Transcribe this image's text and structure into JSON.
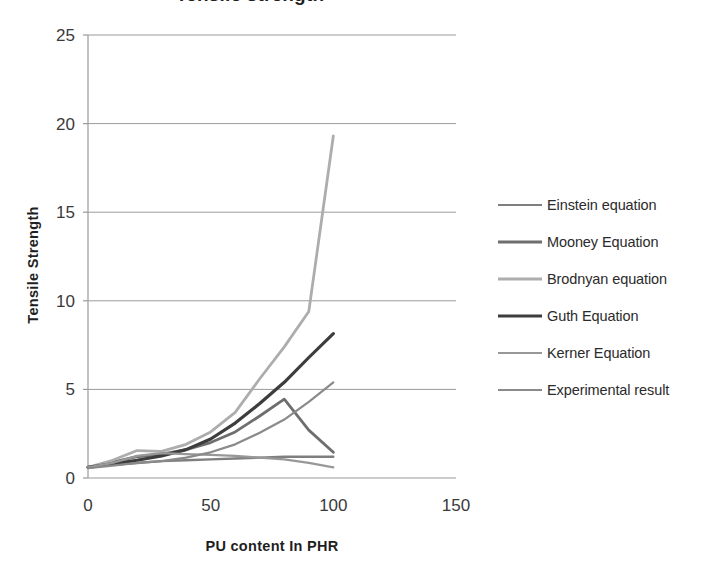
{
  "chart_data": {
    "type": "line",
    "title": "Tensile strength",
    "xlabel": "PU content In PHR",
    "ylabel": "Tensile Strength",
    "xlim": [
      0,
      150
    ],
    "ylim": [
      0,
      25
    ],
    "xticks": [
      0,
      50,
      100,
      150
    ],
    "yticks": [
      0,
      5,
      10,
      15,
      20,
      25
    ],
    "xtick_labels": [
      "0",
      "50",
      "100",
      "150"
    ],
    "ytick_labels": [
      "0",
      "5",
      "10",
      "15",
      "20",
      "25"
    ],
    "grid": "horizontal",
    "legend_position": "right",
    "x": [
      0,
      10,
      20,
      30,
      40,
      50,
      60,
      70,
      80,
      90,
      100
    ],
    "series": [
      {
        "name": "Einstein equation",
        "color": "#7f7f7f",
        "width": 2.4,
        "values": [
          0.6,
          0.75,
          0.85,
          0.95,
          1.0,
          1.05,
          1.1,
          1.15,
          1.2,
          1.2,
          1.2
        ]
      },
      {
        "name": "Mooney Equation",
        "color": "#6e6e6e",
        "width": 2.8,
        "values": [
          0.6,
          0.9,
          1.2,
          1.35,
          1.6,
          2.0,
          2.6,
          3.5,
          4.45,
          2.7,
          1.45
        ]
      },
      {
        "name": "Brodnyan equation",
        "color": "#adadad",
        "width": 2.8,
        "values": [
          0.6,
          1.0,
          1.55,
          1.5,
          1.9,
          2.6,
          3.7,
          5.6,
          7.4,
          9.4,
          19.3
        ]
      },
      {
        "name": "Guth Equation",
        "color": "#3d3d3d",
        "width": 3.2,
        "values": [
          0.6,
          0.8,
          1.0,
          1.25,
          1.6,
          2.2,
          3.1,
          4.2,
          5.4,
          6.8,
          8.15
        ]
      },
      {
        "name": "Kerner Equation",
        "color": "#989898",
        "width": 2.2,
        "values": [
          0.6,
          0.85,
          1.25,
          1.4,
          1.35,
          1.3,
          1.25,
          1.15,
          1.05,
          0.85,
          0.6
        ]
      },
      {
        "name": "Experimental result",
        "color": "#8a8a8a",
        "width": 2.2,
        "values": [
          0.55,
          0.7,
          0.85,
          0.95,
          1.15,
          1.45,
          1.9,
          2.55,
          3.3,
          4.3,
          5.4
        ]
      }
    ]
  },
  "legend": {
    "items": [
      {
        "label": "Einstein equation"
      },
      {
        "label": "Mooney Equation"
      },
      {
        "label": "Brodnyan equation"
      },
      {
        "label": "Guth Equation"
      },
      {
        "label": "Kerner Equation"
      },
      {
        "label": "Experimental result"
      }
    ]
  }
}
